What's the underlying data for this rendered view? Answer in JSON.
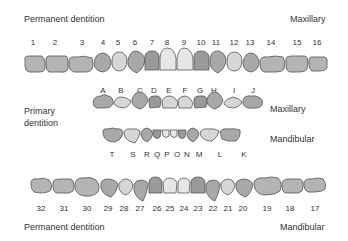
{
  "labels": {
    "permanent_top": "Permanent dentition",
    "maxillary_top": "Maxillary",
    "primary": "Primary\ndentition",
    "primary_line1": "Primary",
    "primary_line2": "dentition",
    "primary_maxillary": "Maxillary",
    "primary_mandibular": "Mandibular",
    "permanent_bottom": "Permanent dentition",
    "mandibular_bottom": "Mandibular"
  },
  "colors": {
    "outline": "#555555",
    "dark": "#9a9a9a",
    "mid": "#b4b4b4",
    "light": "#d6d6d6",
    "lighter": "#e6e6e6"
  },
  "permanent_maxillary": [
    {
      "n": "1",
      "x": 33
    },
    {
      "n": "2",
      "x": 55
    },
    {
      "n": "3",
      "x": 82
    },
    {
      "n": "4",
      "x": 103
    },
    {
      "n": "5",
      "x": 118
    },
    {
      "n": "6",
      "x": 135
    },
    {
      "n": "7",
      "x": 152
    },
    {
      "n": "8",
      "x": 167
    },
    {
      "n": "9",
      "x": 184
    },
    {
      "n": "10",
      "x": 201
    },
    {
      "n": "11",
      "x": 216
    },
    {
      "n": "12",
      "x": 234
    },
    {
      "n": "13",
      "x": 250
    },
    {
      "n": "14",
      "x": 271
    },
    {
      "n": "15",
      "x": 297
    },
    {
      "n": "16",
      "x": 317
    }
  ],
  "primary_maxillary": [
    {
      "n": "A",
      "x": 103
    },
    {
      "n": "B",
      "x": 121
    },
    {
      "n": "C",
      "x": 140
    },
    {
      "n": "D",
      "x": 154
    },
    {
      "n": "E",
      "x": 169
    },
    {
      "n": "F",
      "x": 185
    },
    {
      "n": "G",
      "x": 200
    },
    {
      "n": "H",
      "x": 214
    },
    {
      "n": "I",
      "x": 234
    },
    {
      "n": "J",
      "x": 253
    }
  ],
  "primary_mandibular": [
    {
      "n": "T",
      "x": 112
    },
    {
      "n": "S",
      "x": 133
    },
    {
      "n": "R",
      "x": 147
    },
    {
      "n": "Q",
      "x": 157
    },
    {
      "n": "P",
      "x": 167
    },
    {
      "n": "O",
      "x": 177
    },
    {
      "n": "N",
      "x": 187
    },
    {
      "n": "M",
      "x": 199
    },
    {
      "n": "L",
      "x": 220
    },
    {
      "n": "K",
      "x": 244
    }
  ],
  "permanent_mandibular": [
    {
      "n": "32",
      "x": 41
    },
    {
      "n": "31",
      "x": 64
    },
    {
      "n": "30",
      "x": 87
    },
    {
      "n": "29",
      "x": 108
    },
    {
      "n": "28",
      "x": 124
    },
    {
      "n": "27",
      "x": 140
    },
    {
      "n": "26",
      "x": 157
    },
    {
      "n": "25",
      "x": 170
    },
    {
      "n": "24",
      "x": 184
    },
    {
      "n": "23",
      "x": 198
    },
    {
      "n": "22",
      "x": 213
    },
    {
      "n": "21",
      "x": 228
    },
    {
      "n": "20",
      "x": 243
    },
    {
      "n": "19",
      "x": 267
    },
    {
      "n": "18",
      "x": 290
    },
    {
      "n": "17",
      "x": 315
    }
  ]
}
